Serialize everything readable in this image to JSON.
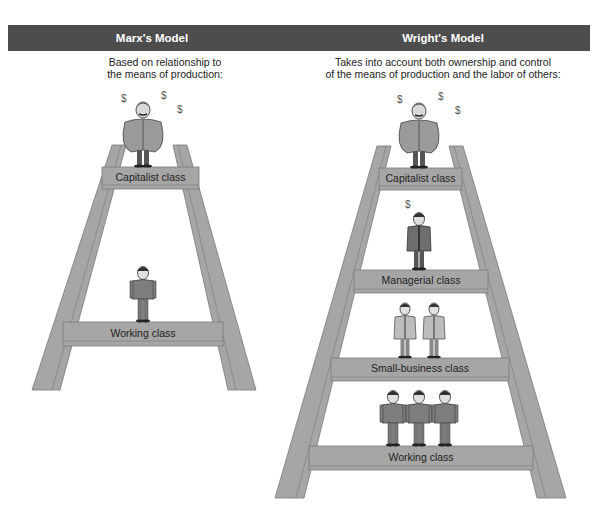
{
  "models": {
    "marx": {
      "title": "Marx's Model",
      "description_line1": "Based on relationship to",
      "description_line2": "the means of production:",
      "classes": [
        {
          "label": "Capitalist class",
          "figures": 1,
          "figure_style": "capitalist",
          "dollar_signs": 3
        },
        {
          "label": "Working class",
          "figures": 1,
          "figure_style": "worker",
          "dollar_signs": 0
        }
      ]
    },
    "wright": {
      "title": "Wright's Model",
      "description_line1": "Takes into account both ownership and control",
      "description_line2": "of the means of production and the labor of others:",
      "classes": [
        {
          "label": "Capitalist class",
          "figures": 1,
          "figure_style": "capitalist",
          "dollar_signs": 3
        },
        {
          "label": "Managerial class",
          "figures": 1,
          "figure_style": "manager",
          "dollar_signs": 1
        },
        {
          "label": "Small-business class",
          "figures": 2,
          "figure_style": "small-business",
          "dollar_signs": 0
        },
        {
          "label": "Working class",
          "figures": 3,
          "figure_style": "worker",
          "dollar_signs": 0
        }
      ]
    }
  },
  "symbols": {
    "dollar": "$"
  },
  "colors": {
    "header_bg": "#4d4d4d",
    "header_text": "#ffffff",
    "ladder_fill": "#a6a6a6",
    "ladder_edge": "#7a7a7a",
    "capitalist_suit": "#9a9a9a",
    "worker_shirt": "#7d7d7d",
    "manager_suit": "#6e6e6e",
    "small_business_coat": "#bdbdbd"
  }
}
